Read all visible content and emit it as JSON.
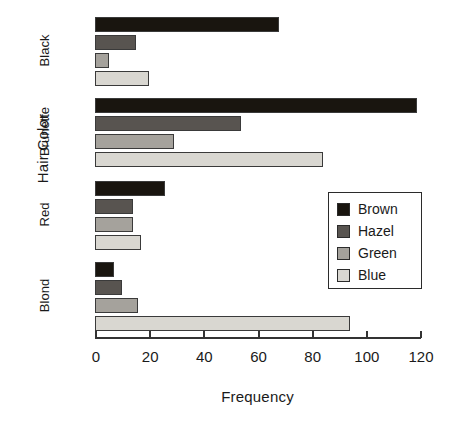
{
  "chart_data": {
    "type": "bar",
    "orientation": "horizontal",
    "grouped": true,
    "title": "",
    "xlabel": "Frequency",
    "ylabel": "Hair Color",
    "categories": [
      "Black",
      "Brunette",
      "Red",
      "Blond"
    ],
    "series": [
      {
        "name": "Brown",
        "color": "#19150f",
        "values": [
          68,
          119,
          26,
          7
        ]
      },
      {
        "name": "Hazel",
        "color": "#585450",
        "values": [
          15,
          54,
          14,
          10
        ]
      },
      {
        "name": "Green",
        "color": "#a5a29c",
        "values": [
          5,
          29,
          14,
          16
        ]
      },
      {
        "name": "Blue",
        "color": "#d9d7d1",
        "values": [
          20,
          84,
          17,
          94
        ]
      }
    ],
    "xlim": [
      0,
      120
    ],
    "xticks": [
      0,
      20,
      40,
      60,
      80,
      100,
      120
    ],
    "xtick_labels": [
      "0",
      "20",
      "40",
      "60",
      "80",
      "100",
      "120"
    ],
    "grid": false,
    "legend": {
      "position": "center-right",
      "entries": [
        "Brown",
        "Hazel",
        "Green",
        "Blue"
      ]
    }
  },
  "axis": {
    "x_title": "Frequency",
    "y_title": "Hair Color"
  }
}
